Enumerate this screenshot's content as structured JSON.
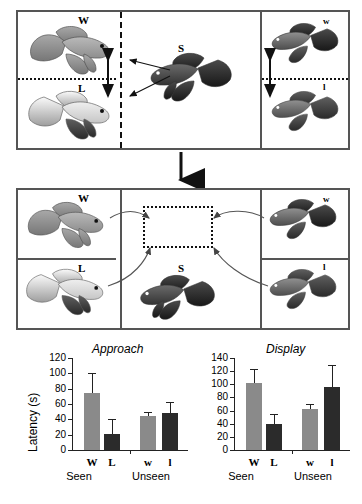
{
  "figure": {
    "caption_present": false,
    "top_panel": {
      "name": "pre-test-phase",
      "cells": [
        {
          "id": "top-left-upper",
          "label": "W"
        },
        {
          "id": "top-left-lower",
          "label": "L"
        },
        {
          "id": "top-center",
          "label": "S"
        },
        {
          "id": "top-right-upper",
          "label": "w"
        },
        {
          "id": "top-right-lower",
          "label": "l"
        }
      ]
    },
    "bottom_panel": {
      "name": "test-phase",
      "cells": [
        {
          "id": "bot-left-upper",
          "label": "W"
        },
        {
          "id": "bot-left-lower",
          "label": "L"
        },
        {
          "id": "bot-center",
          "label": "S"
        },
        {
          "id": "bot-right-upper",
          "label": "w"
        },
        {
          "id": "bot-right-lower",
          "label": "l"
        }
      ]
    },
    "colors": {
      "panel_border": "#555555",
      "bar_light": "#8a8a8a",
      "bar_dark": "#2b2b2b",
      "axis": "#222222"
    }
  },
  "chart_data": [
    {
      "type": "bar",
      "title": "Approach",
      "xlabel": "",
      "ylabel": "Latency (s)",
      "ylim": [
        0,
        120
      ],
      "yticks": [
        0,
        20,
        40,
        60,
        80,
        100,
        120
      ],
      "grid": false,
      "legend": "none",
      "groups": [
        "Seen",
        "Unseen"
      ],
      "categories": [
        "W",
        "L",
        "w",
        "l"
      ],
      "values": [
        74,
        21,
        44,
        48
      ],
      "errors": [
        27,
        19,
        5,
        14
      ],
      "bar_colors": [
        "light",
        "dark",
        "light",
        "dark"
      ]
    },
    {
      "type": "bar",
      "title": "Display",
      "xlabel": "",
      "ylabel": "",
      "ylim": [
        0,
        140
      ],
      "yticks": [
        0,
        20,
        40,
        60,
        80,
        100,
        120,
        140
      ],
      "grid": false,
      "legend": "none",
      "groups": [
        "Seen",
        "Unseen"
      ],
      "categories": [
        "W",
        "L",
        "w",
        "l"
      ],
      "values": [
        102,
        40,
        62,
        96
      ],
      "errors": [
        22,
        15,
        8,
        33
      ],
      "bar_colors": [
        "light",
        "dark",
        "light",
        "dark"
      ]
    }
  ]
}
